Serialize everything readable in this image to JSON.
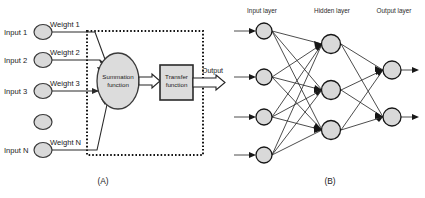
{
  "figure": {
    "background_color": "#ffffff",
    "node_fill_color": "#d9d9d9",
    "node_stroke_color": "#171717",
    "line_color": "#2a2a2a"
  },
  "panel_a": {
    "caption": "(A)",
    "inputs": [
      {
        "label": "Input 1",
        "weight": "Weight 1"
      },
      {
        "label": "Input 2",
        "weight": "Weight 2"
      },
      {
        "label": "Input 3",
        "weight": "Weight 3"
      },
      {
        "label": "",
        "weight": ""
      },
      {
        "label": "Input N",
        "weight": "Weight N"
      }
    ],
    "summation": {
      "line1": "Summation",
      "line2": "function"
    },
    "transfer": {
      "line1": "Transfer",
      "line2": "function"
    },
    "output_label": "Output"
  },
  "panel_b": {
    "caption": "(B)",
    "layers": [
      {
        "name": "Input layer",
        "node_count": 4
      },
      {
        "name": "Hidden layer",
        "node_count": 3
      },
      {
        "name": "Output layer",
        "node_count": 2
      }
    ]
  }
}
